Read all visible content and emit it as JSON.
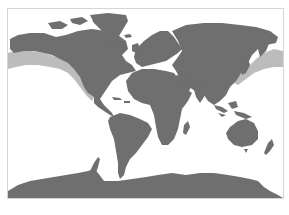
{
  "map": {
    "projection": "world",
    "colors": {
      "background": "#ffffff",
      "land": "#6f6f6f",
      "highlight": "#bcbcbc",
      "frame": "#d6d6d6"
    },
    "highlighted_region": "North Pacific coastal band (western North America, Alaska, Kamchatka, Japan)",
    "continents": [
      "North America",
      "Greenland",
      "South America",
      "Europe",
      "Africa",
      "Asia",
      "Australia",
      "Antarctica"
    ]
  }
}
